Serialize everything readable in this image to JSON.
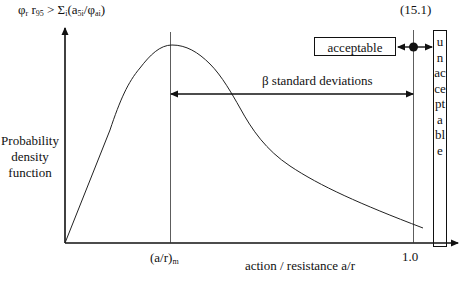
{
  "header": {
    "formula_phi": "φ",
    "formula_phi_sub": "r",
    "formula_r": " r",
    "formula_r_sub": "95",
    "formula_gt": " > Σ",
    "formula_sigma_sub": "i",
    "formula_open": "(a",
    "formula_a_sub": "5i",
    "formula_slash": "/φ",
    "formula_phi2_sub": "ai",
    "formula_close": ")",
    "equation_number": "(15.1)"
  },
  "axes": {
    "y_label": "Probability density function",
    "x_label": "action / resistance a/r",
    "x_tick_mean": "(a/r)",
    "x_tick_mean_sub": "m",
    "x_tick_one": "1.0"
  },
  "annotations": {
    "beta_label": "β standard deviations",
    "acceptable_label": "acceptable",
    "unacceptable_label": "unacceptable"
  },
  "colors": {
    "line": "#111111",
    "background": "#ffffff"
  }
}
